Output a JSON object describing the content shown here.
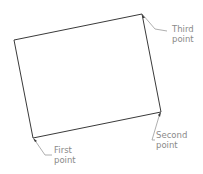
{
  "diagram": {
    "shape": "rectangle (rotated)",
    "stroke_color": "#3a3a3a",
    "leader_color": "#9a9a9a",
    "label_color": "#8a8a8a",
    "corners": {
      "top_left": [
        14,
        40
      ],
      "top_right": [
        142,
        14
      ],
      "bottom_right": [
        161,
        112
      ],
      "bottom_left": [
        33,
        138
      ]
    },
    "labels": [
      {
        "id": "first",
        "line1": "First",
        "line2": "point",
        "anchor": "bottom_left"
      },
      {
        "id": "second",
        "line1": "Second",
        "line2": "point",
        "anchor": "bottom_right"
      },
      {
        "id": "third",
        "line1": "Third",
        "line2": "point",
        "anchor": "top_right"
      }
    ]
  }
}
